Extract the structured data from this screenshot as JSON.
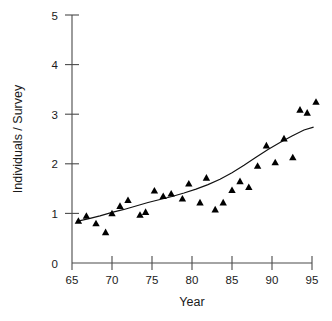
{
  "chart_data": {
    "type": "scatter",
    "title": "",
    "subtitle": "",
    "xlabel": "Year",
    "ylabel": "Individuals / Survey",
    "xlim": [
      65,
      95
    ],
    "ylim": [
      0,
      5
    ],
    "xticks": [
      65,
      70,
      75,
      80,
      85,
      90,
      95
    ],
    "xtick_labels": [
      "65",
      "70",
      "75",
      "80",
      "85",
      "90",
      "95"
    ],
    "yticks": [
      0,
      1,
      2,
      3,
      4,
      5
    ],
    "ytick_labels": [
      "0",
      "1",
      "2",
      "3",
      "4",
      "5"
    ],
    "grid": false,
    "legend": false,
    "legend_position": "none",
    "marker_style": "filled-triangle",
    "marker_color": "#000000",
    "axis_color": "#4a4a4a",
    "curve_color": "#111111",
    "series": [
      {
        "name": "Individuals per survey",
        "type": "scatter",
        "x": [
          65.8,
          66.8,
          68.0,
          69.2,
          70.0,
          71.0,
          72.0,
          73.5,
          74.2,
          75.3,
          76.4,
          77.4,
          78.8,
          79.6,
          81.0,
          81.8,
          82.9,
          83.9,
          85.0,
          86.0,
          87.1,
          88.2,
          89.3,
          90.4,
          91.5,
          92.6,
          93.5,
          94.4,
          95.5
        ],
        "y": [
          0.85,
          0.95,
          0.8,
          0.62,
          1.0,
          1.15,
          1.27,
          0.97,
          1.03,
          1.46,
          1.35,
          1.4,
          1.3,
          1.6,
          1.22,
          1.72,
          1.08,
          1.22,
          1.47,
          1.65,
          1.53,
          1.96,
          2.37,
          2.03,
          2.51,
          2.13,
          3.09,
          3.03,
          3.25
        ]
      },
      {
        "name": "Fitted exponential trend",
        "type": "line",
        "x": [
          65.6,
          67.0,
          68.5,
          70.0,
          71.5,
          73.0,
          74.5,
          76.0,
          77.5,
          79.0,
          80.5,
          82.0,
          83.5,
          85.0,
          86.5,
          88.0,
          89.5,
          91.0,
          92.5,
          94.0,
          95.2
        ],
        "y": [
          0.84,
          0.89,
          0.95,
          1.02,
          1.08,
          1.15,
          1.22,
          1.28,
          1.34,
          1.41,
          1.49,
          1.58,
          1.69,
          1.82,
          1.97,
          2.13,
          2.29,
          2.43,
          2.56,
          2.68,
          2.74
        ]
      }
    ],
    "annotations": []
  },
  "axes": {
    "x_label": "Year",
    "y_label": "Individuals / Survey"
  }
}
